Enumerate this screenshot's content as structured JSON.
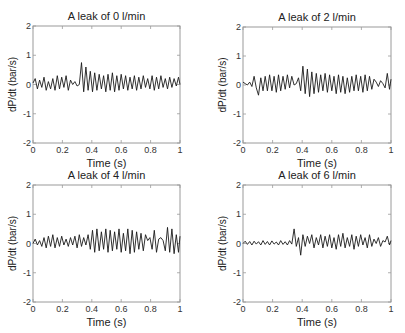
{
  "chart_data": [
    {
      "type": "line",
      "title": "A leak of 0 l/min",
      "xlabel": "Time (s)",
      "ylabel": "dP/dt (bar/s)",
      "xlim": [
        0,
        1
      ],
      "ylim": [
        -2,
        2
      ],
      "xticks": [
        "0",
        "0.2",
        "0.4",
        "0.6",
        "0.8",
        "1"
      ],
      "yticks": [
        "2",
        "1",
        "0",
        "-1",
        "-2"
      ],
      "grid": false,
      "series": [
        {
          "name": "dP/dt",
          "x": [
            0,
            0.015,
            0.03,
            0.045,
            0.06,
            0.075,
            0.09,
            0.105,
            0.12,
            0.135,
            0.15,
            0.165,
            0.18,
            0.195,
            0.21,
            0.225,
            0.24,
            0.255,
            0.27,
            0.285,
            0.3,
            0.315,
            0.33,
            0.345,
            0.36,
            0.375,
            0.39,
            0.405,
            0.42,
            0.435,
            0.45,
            0.465,
            0.48,
            0.495,
            0.51,
            0.525,
            0.54,
            0.555,
            0.57,
            0.585,
            0.6,
            0.615,
            0.63,
            0.645,
            0.66,
            0.675,
            0.69,
            0.705,
            0.72,
            0.735,
            0.75,
            0.765,
            0.78,
            0.795,
            0.81,
            0.825,
            0.84,
            0.855,
            0.87,
            0.885,
            0.9,
            0.915,
            0.93,
            0.945,
            0.96,
            0.975,
            0.99,
            1.0
          ],
          "values": [
            0.05,
            0.2,
            -0.15,
            0.15,
            -0.1,
            0.25,
            -0.2,
            0.1,
            -0.15,
            0.2,
            -0.2,
            0.3,
            -0.15,
            0.25,
            -0.1,
            0.3,
            -0.2,
            0.15,
            0.0,
            0.1,
            -0.05,
            0.0,
            0.75,
            -0.25,
            0.6,
            -0.2,
            0.45,
            -0.25,
            0.4,
            -0.2,
            0.35,
            -0.15,
            0.3,
            -0.25,
            0.35,
            -0.2,
            0.4,
            -0.25,
            0.3,
            -0.2,
            0.35,
            -0.15,
            0.3,
            -0.2,
            0.25,
            -0.15,
            0.3,
            -0.2,
            0.25,
            -0.15,
            0.3,
            -0.1,
            0.2,
            -0.15,
            0.3,
            -0.2,
            0.25,
            -0.15,
            0.3,
            -0.1,
            0.2,
            -0.15,
            0.25,
            -0.1,
            0.2,
            -0.05,
            0.25,
            0.0
          ]
        }
      ]
    },
    {
      "type": "line",
      "title": "A leak of 2 l/min",
      "xlabel": "Time (s)",
      "ylabel": "dP/dt (bar/s)",
      "xlim": [
        0,
        1
      ],
      "ylim": [
        -2,
        2
      ],
      "xticks": [
        "0",
        "0.2",
        "0.4",
        "0.6",
        "0.8",
        "1"
      ],
      "yticks": [
        "2",
        "1",
        "0",
        "-1",
        "-2"
      ],
      "grid": false,
      "series": [
        {
          "name": "dP/dt",
          "x": [
            0,
            0.015,
            0.03,
            0.045,
            0.06,
            0.075,
            0.09,
            0.105,
            0.12,
            0.135,
            0.15,
            0.165,
            0.18,
            0.195,
            0.21,
            0.225,
            0.24,
            0.255,
            0.27,
            0.285,
            0.3,
            0.315,
            0.33,
            0.345,
            0.36,
            0.375,
            0.39,
            0.405,
            0.42,
            0.435,
            0.45,
            0.465,
            0.48,
            0.495,
            0.51,
            0.525,
            0.54,
            0.555,
            0.57,
            0.585,
            0.6,
            0.615,
            0.63,
            0.645,
            0.66,
            0.675,
            0.69,
            0.705,
            0.72,
            0.735,
            0.75,
            0.765,
            0.78,
            0.795,
            0.81,
            0.825,
            0.84,
            0.855,
            0.87,
            0.885,
            0.9,
            0.915,
            0.93,
            0.945,
            0.96,
            0.975,
            0.99,
            1.0
          ],
          "values": [
            0.1,
            0.05,
            0.0,
            0.1,
            -0.05,
            0.3,
            -0.1,
            -0.35,
            0.25,
            -0.2,
            0.3,
            -0.2,
            0.35,
            -0.2,
            0.3,
            -0.25,
            0.35,
            -0.2,
            0.3,
            -0.15,
            0.35,
            -0.1,
            0.3,
            0.0,
            0.05,
            0.25,
            -0.2,
            0.65,
            -0.3,
            0.55,
            -0.4,
            0.45,
            -0.3,
            0.4,
            -0.25,
            0.35,
            -0.2,
            0.4,
            -0.25,
            0.35,
            -0.2,
            0.3,
            -0.3,
            0.35,
            -0.25,
            0.3,
            -0.3,
            0.25,
            -0.25,
            0.3,
            -0.2,
            0.35,
            -0.2,
            0.3,
            -0.25,
            0.35,
            -0.2,
            0.3,
            -0.15,
            0.2,
            0.1,
            -0.05,
            0.15,
            0.05,
            -0.1,
            0.4,
            -0.15,
            0.2
          ]
        }
      ]
    },
    {
      "type": "line",
      "title": "A leak of 4 l/min",
      "xlabel": "Time (s)",
      "ylabel": "dP/dt (bar/s)",
      "xlim": [
        0,
        1
      ],
      "ylim": [
        -2,
        2
      ],
      "xticks": [
        "0",
        "0.2",
        "0.4",
        "0.6",
        "0.8",
        "1"
      ],
      "yticks": [
        "2",
        "1",
        "0",
        "-1",
        "-2"
      ],
      "grid": false,
      "series": [
        {
          "name": "dP/dt",
          "x": [
            0,
            0.015,
            0.03,
            0.045,
            0.06,
            0.075,
            0.09,
            0.105,
            0.12,
            0.135,
            0.15,
            0.165,
            0.18,
            0.195,
            0.21,
            0.225,
            0.24,
            0.255,
            0.27,
            0.285,
            0.3,
            0.315,
            0.33,
            0.345,
            0.36,
            0.375,
            0.39,
            0.405,
            0.42,
            0.435,
            0.45,
            0.465,
            0.48,
            0.495,
            0.51,
            0.525,
            0.54,
            0.555,
            0.57,
            0.585,
            0.6,
            0.615,
            0.63,
            0.645,
            0.66,
            0.675,
            0.69,
            0.705,
            0.72,
            0.735,
            0.75,
            0.765,
            0.78,
            0.795,
            0.81,
            0.825,
            0.84,
            0.855,
            0.87,
            0.885,
            0.9,
            0.915,
            0.93,
            0.945,
            0.96,
            0.975,
            0.99,
            1.0
          ],
          "values": [
            0.0,
            0.15,
            -0.05,
            0.1,
            -0.1,
            0.2,
            -0.15,
            0.25,
            -0.1,
            0.3,
            -0.15,
            0.2,
            -0.1,
            0.25,
            -0.05,
            0.15,
            -0.1,
            0.2,
            -0.05,
            0.25,
            -0.15,
            0.3,
            -0.1,
            0.2,
            -0.05,
            0.3,
            -0.2,
            0.45,
            -0.3,
            0.5,
            -0.25,
            0.4,
            -0.2,
            0.5,
            -0.3,
            0.45,
            -0.25,
            0.4,
            -0.2,
            0.5,
            -0.3,
            0.35,
            -0.25,
            0.5,
            -0.35,
            0.45,
            -0.3,
            0.4,
            -0.2,
            0.35,
            -0.25,
            0.3,
            0.1,
            0.2,
            -0.2,
            0.45,
            -0.3,
            0.15,
            0.2,
            0.1,
            -0.25,
            0.55,
            -0.3,
            0.5,
            -0.35,
            0.3,
            -0.3,
            0.25
          ]
        }
      ]
    },
    {
      "type": "line",
      "title": "A leak of 6 l/min",
      "xlabel": "Time (s)",
      "ylabel": "dP/dt (bar/s)",
      "xlim": [
        0,
        1
      ],
      "ylim": [
        -2,
        2
      ],
      "xticks": [
        "0",
        "0.2",
        "0.4",
        "0.6",
        "0.8",
        "1"
      ],
      "yticks": [
        "2",
        "1",
        "0",
        "-1",
        "-2"
      ],
      "grid": false,
      "series": [
        {
          "name": "dP/dt",
          "x": [
            0,
            0.015,
            0.03,
            0.045,
            0.06,
            0.075,
            0.09,
            0.105,
            0.12,
            0.135,
            0.15,
            0.165,
            0.18,
            0.195,
            0.21,
            0.225,
            0.24,
            0.255,
            0.27,
            0.285,
            0.3,
            0.315,
            0.33,
            0.345,
            0.36,
            0.375,
            0.39,
            0.405,
            0.42,
            0.435,
            0.45,
            0.465,
            0.48,
            0.495,
            0.51,
            0.525,
            0.54,
            0.555,
            0.57,
            0.585,
            0.6,
            0.615,
            0.63,
            0.645,
            0.66,
            0.675,
            0.69,
            0.705,
            0.72,
            0.735,
            0.75,
            0.765,
            0.78,
            0.795,
            0.81,
            0.825,
            0.84,
            0.855,
            0.87,
            0.885,
            0.9,
            0.915,
            0.93,
            0.945,
            0.96,
            0.975,
            0.99,
            1.0
          ],
          "values": [
            0.0,
            0.08,
            -0.03,
            0.07,
            -0.05,
            0.08,
            -0.02,
            0.06,
            -0.05,
            0.1,
            -0.03,
            0.07,
            -0.05,
            0.09,
            -0.02,
            0.05,
            -0.05,
            0.1,
            -0.03,
            0.06,
            -0.05,
            0.1,
            -0.02,
            0.5,
            -0.1,
            0.2,
            -0.4,
            0.3,
            -0.1,
            0.25,
            0.0,
            0.3,
            -0.15,
            0.2,
            -0.05,
            0.3,
            -0.15,
            0.25,
            -0.1,
            0.3,
            -0.15,
            0.2,
            -0.2,
            0.3,
            -0.1,
            0.35,
            -0.15,
            0.2,
            -0.1,
            0.3,
            -0.2,
            0.25,
            -0.1,
            0.3,
            -0.05,
            0.2,
            -0.15,
            0.3,
            -0.1,
            0.15,
            0.0,
            0.2,
            -0.1,
            0.1,
            0.05,
            0.25,
            -0.05,
            0.1
          ]
        }
      ]
    }
  ]
}
